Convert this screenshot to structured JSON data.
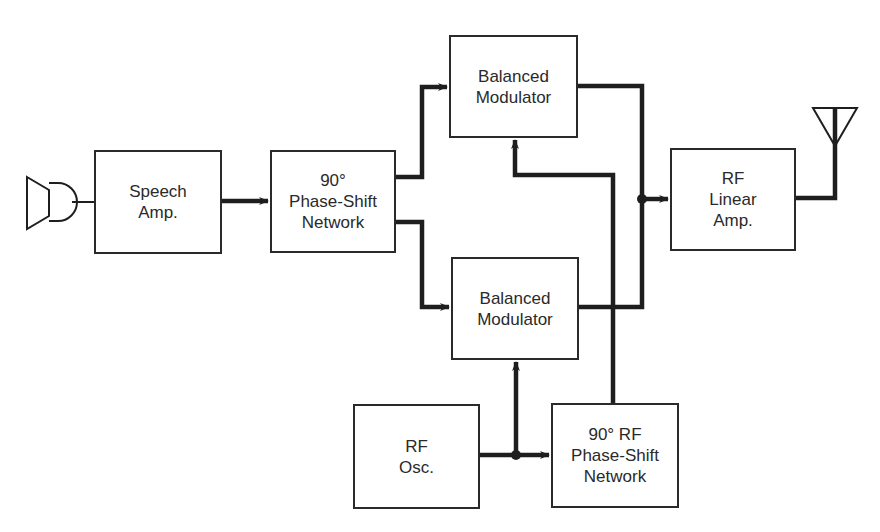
{
  "diagram": {
    "blocks": {
      "speech_amp": {
        "label": "Speech\nAmp."
      },
      "phase_shift_af": {
        "label": "90°\nPhase-Shift\nNetwork"
      },
      "balanced_mod_top": {
        "label": "Balanced\nModulator"
      },
      "balanced_mod_bottom": {
        "label": "Balanced\nModulator"
      },
      "rf_linear_amp": {
        "label": "RF\nLinear\nAmp."
      },
      "rf_osc": {
        "label": "RF\nOsc."
      },
      "phase_shift_rf": {
        "label": "90° RF\nPhase-Shift\nNetwork"
      }
    },
    "symbols": [
      "microphone-icon",
      "antenna-icon"
    ],
    "connections": [
      {
        "from": "microphone",
        "to": "speech_amp"
      },
      {
        "from": "speech_amp",
        "to": "phase_shift_af"
      },
      {
        "from": "phase_shift_af",
        "to": "balanced_mod_top"
      },
      {
        "from": "phase_shift_af",
        "to": "balanced_mod_bottom"
      },
      {
        "from": "rf_osc",
        "to": "balanced_mod_bottom"
      },
      {
        "from": "rf_osc",
        "to": "phase_shift_rf"
      },
      {
        "from": "phase_shift_rf",
        "to": "balanced_mod_top"
      },
      {
        "from": "balanced_mod_top",
        "to": "rf_linear_amp"
      },
      {
        "from": "balanced_mod_bottom",
        "to": "rf_linear_amp"
      },
      {
        "from": "rf_linear_amp",
        "to": "antenna"
      }
    ]
  }
}
